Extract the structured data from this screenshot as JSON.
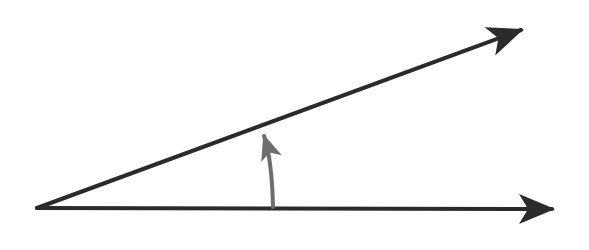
{
  "diagram": {
    "type": "angle",
    "colors": {
      "ray": "#2b2b2b",
      "arc": "#6e6e6e",
      "background": "#ffffff"
    },
    "vertex": [
      37,
      208
    ],
    "rays": [
      {
        "name": "initial-side",
        "from": [
          37,
          208
        ],
        "to": [
          556,
          209
        ]
      },
      {
        "name": "terminal-side",
        "from": [
          37,
          208
        ],
        "to": [
          525,
          28
        ]
      }
    ],
    "rotation_arc": {
      "from": [
        273,
        208
      ],
      "to": [
        262,
        128
      ],
      "direction": "counterclockwise"
    }
  }
}
